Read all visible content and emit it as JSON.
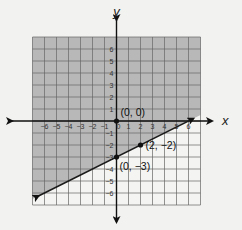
{
  "chart_data": {
    "type": "line",
    "title": "",
    "xlabel": "x",
    "ylabel": "y",
    "xlim": [
      -7,
      7
    ],
    "ylim": [
      -7,
      7
    ],
    "grid": true,
    "x_ticks": [
      -6,
      -5,
      -4,
      -3,
      -2,
      -1,
      0,
      1,
      2,
      3,
      4,
      5,
      6
    ],
    "y_ticks": [
      -6,
      -5,
      -4,
      -3,
      -2,
      -1,
      0,
      1,
      2,
      3,
      4,
      5,
      6
    ],
    "x_tick_labels": [
      "−6",
      "−5",
      "−4",
      "−3",
      "−2",
      "−1",
      "0",
      "1",
      "2",
      "3",
      "4",
      "5",
      "6"
    ],
    "y_tick_labels": [
      "6",
      "5",
      "4",
      "3",
      "2",
      "1",
      "−1",
      "−2",
      "−3",
      "−4",
      "−5",
      "−6"
    ],
    "series": [
      {
        "name": "boundary line",
        "equation": "y = 1/2 x − 3",
        "slope": 0.5,
        "intercept": -3,
        "x": [
          -6.5,
          6.4
        ],
        "y": [
          -6.25,
          0.2
        ],
        "style": "solid",
        "arrows": "both"
      }
    ],
    "shaded_region": "above line (y ≥ 1/2 x − 3)",
    "points": [
      {
        "label": "(0, 0)",
        "x": 0,
        "y": 0
      },
      {
        "label": "(2, −2)",
        "x": 2,
        "y": -2
      },
      {
        "label": "(0, −3)",
        "x": 0,
        "y": -3
      }
    ],
    "colors": {
      "shade": "#b8b8b8",
      "unshaded": "#f4f4f2",
      "grid": "#666666",
      "axis": "#111111",
      "line": "#1a1a1a"
    }
  }
}
